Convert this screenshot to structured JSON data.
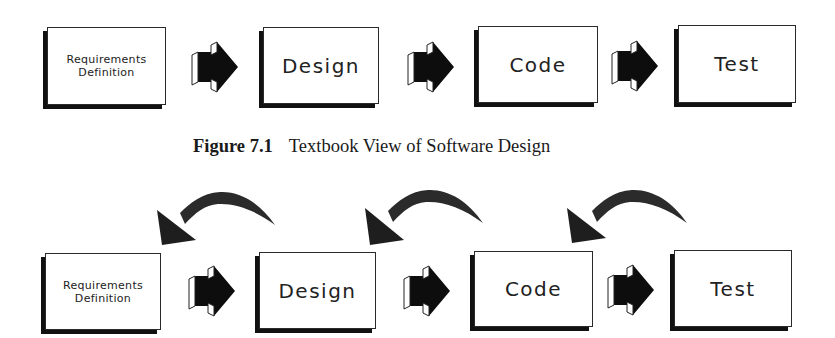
{
  "figure_top": {
    "boxes": [
      {
        "label": "Requirements\nDefinition",
        "size": "small"
      },
      {
        "label": "Design",
        "size": "big"
      },
      {
        "label": "Code",
        "size": "big"
      },
      {
        "label": "Test",
        "size": "big"
      }
    ],
    "arrows": [
      "block-arrow-right",
      "block-arrow-right",
      "block-arrow-right"
    ]
  },
  "caption": {
    "number": "Figure 7.1",
    "title": "Textbook View of Software Design"
  },
  "figure_bottom": {
    "boxes": [
      {
        "label": "Requirements\nDefinition",
        "size": "small"
      },
      {
        "label": "Design",
        "size": "big"
      },
      {
        "label": "Code",
        "size": "big"
      },
      {
        "label": "Test",
        "size": "big"
      }
    ],
    "arrows": [
      "block-arrow-right",
      "block-arrow-right",
      "block-arrow-right"
    ],
    "feedback_arrows": [
      "curved-arrow-back",
      "curved-arrow-back",
      "curved-arrow-back"
    ]
  },
  "colors": {
    "box_fill": "#ffffff",
    "box_border": "#2a2a2a",
    "shadow": "#111111",
    "arrow_fill": "#0d0d0d",
    "curve_fill": "#2b2b2b"
  }
}
